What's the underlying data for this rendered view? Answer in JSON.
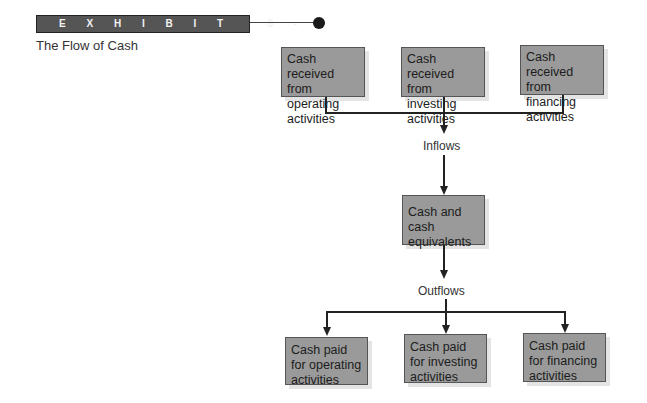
{
  "exhibit": {
    "banner": "EXHIBIT 8-3",
    "title": "The Flow of Cash"
  },
  "colors": {
    "box_fill": "#9a9a9a",
    "banner_fill": "#555555",
    "line": "#222222"
  },
  "inflow_sources": [
    {
      "label": "Cash received from operating activities"
    },
    {
      "label": "Cash received from investing activities"
    },
    {
      "label": "Cash received from financing activities"
    }
  ],
  "inflows_label": "Inflows",
  "center": {
    "label": "Cash and cash equivalents"
  },
  "outflows_label": "Outflows",
  "outflow_uses": [
    {
      "label": "Cash paid for operating activities"
    },
    {
      "label": "Cash paid for investing activities"
    },
    {
      "label": "Cash paid for financing activities"
    }
  ]
}
